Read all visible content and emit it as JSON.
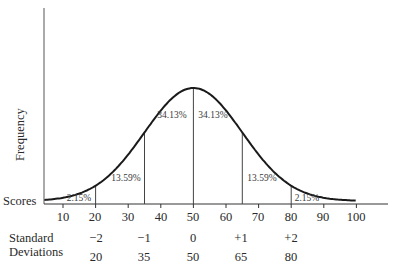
{
  "chart_data": {
    "type": "line",
    "title": "",
    "xlabel": "Scores",
    "ylabel": "Frequency",
    "distribution": "normal",
    "mean": 50,
    "sd": 15,
    "x_ticks": [
      10,
      20,
      30,
      40,
      50,
      60,
      70,
      80,
      90,
      100
    ],
    "xlim": [
      0,
      110
    ],
    "grid": false,
    "legend": null,
    "divider_lines_at": [
      20,
      35,
      50,
      65,
      80
    ],
    "regions": [
      {
        "range": "<20",
        "percent": "2.15%"
      },
      {
        "range": "20-35",
        "percent": "13.59%"
      },
      {
        "range": "35-50",
        "percent": "34.13%"
      },
      {
        "range": "50-65",
        "percent": "34.13%"
      },
      {
        "range": "65-80",
        "percent": "13.59%"
      },
      {
        "range": ">80",
        "percent": "2.15%"
      }
    ],
    "standard_deviations": {
      "label": [
        "Standard",
        "Deviations"
      ],
      "sd_values": [
        "−2",
        "−1",
        "0",
        "+1",
        "+2"
      ],
      "scores": [
        "20",
        "35",
        "50",
        "65",
        "80"
      ]
    }
  },
  "labels": {
    "y_axis": "Frequency",
    "x_axis": "Scores",
    "sd_line1": "Standard",
    "sd_line2": "Deviations",
    "ticks": [
      "10",
      "20",
      "30",
      "40",
      "50",
      "60",
      "70",
      "80",
      "90",
      "100"
    ],
    "pcts": [
      "2.15%",
      "13.59%",
      "34.13%",
      "34.13%",
      "13.59%",
      "2.15%"
    ],
    "sds": [
      "−2",
      "−1",
      "0",
      "+1",
      "+2"
    ],
    "sd_scores": [
      "20",
      "35",
      "50",
      "65",
      "80"
    ]
  }
}
